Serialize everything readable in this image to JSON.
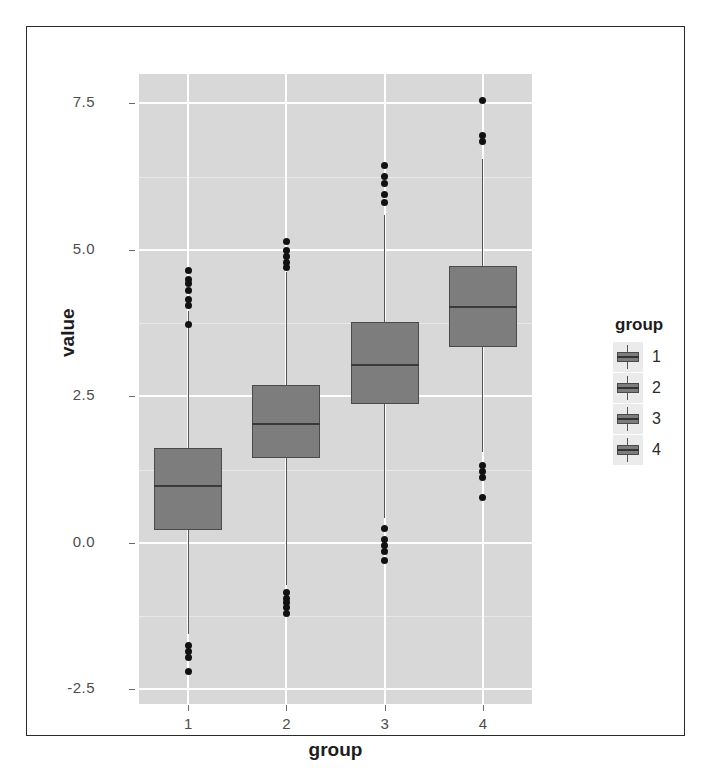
{
  "chart_data": {
    "type": "boxplot",
    "title": "",
    "xlabel": "group",
    "ylabel": "value",
    "categories": [
      "1",
      "2",
      "3",
      "4"
    ],
    "x_tick_labels": [
      "1",
      "2",
      "3",
      "4"
    ],
    "y_tick_labels": [
      "7.5",
      "5.0",
      "2.5",
      "0.0",
      "-2.5"
    ],
    "y_tick_values": [
      7.5,
      5.0,
      2.5,
      0.0,
      -2.5
    ],
    "ylim": [
      -2.75,
      8.0
    ],
    "grid": true,
    "legend": {
      "title": "group",
      "position": "right",
      "entries": [
        "1",
        "2",
        "3",
        "4"
      ]
    },
    "boxes": [
      {
        "group": "1",
        "whisker_low": -1.55,
        "q1": 0.22,
        "median": 0.97,
        "q3": 1.62,
        "whisker_high": 3.95,
        "outliers_high": [
          4.65,
          4.5,
          4.42,
          4.3,
          4.16,
          4.05,
          3.72
        ],
        "outliers_low": [
          -1.75,
          -1.85,
          -1.95,
          -2.2
        ]
      },
      {
        "group": "2",
        "whisker_low": -0.72,
        "q1": 1.45,
        "median": 2.03,
        "q3": 2.7,
        "whisker_high": 4.62,
        "outliers_high": [
          5.15,
          4.98,
          4.88,
          4.78,
          4.7
        ],
        "outliers_low": [
          -0.85,
          -0.95,
          -1.02,
          -1.1,
          -1.2
        ]
      },
      {
        "group": "3",
        "whisker_low": 0.43,
        "q1": 2.37,
        "median": 3.03,
        "q3": 3.76,
        "whisker_high": 5.6,
        "outliers_high": [
          6.44,
          6.25,
          6.13,
          5.95,
          5.8
        ],
        "outliers_low": [
          0.25,
          0.05,
          -0.05,
          -0.15,
          -0.3
        ]
      },
      {
        "group": "4",
        "whisker_low": 1.55,
        "q1": 3.35,
        "median": 4.03,
        "q3": 4.72,
        "whisker_high": 6.55,
        "outliers_high": [
          7.55,
          6.95,
          6.85
        ],
        "outliers_low": [
          1.32,
          1.22,
          1.12,
          0.78
        ]
      }
    ],
    "colors": {
      "panel_background": "#d8d8d8",
      "box_fill": "#7d7d7d",
      "box_border": "#4a4a4a",
      "median": "#3a3a3a",
      "outlier": "#111111",
      "gridline_major": "#ffffff",
      "axis_text": "#4d4d4d",
      "label_text": "#1d1d1d"
    }
  }
}
